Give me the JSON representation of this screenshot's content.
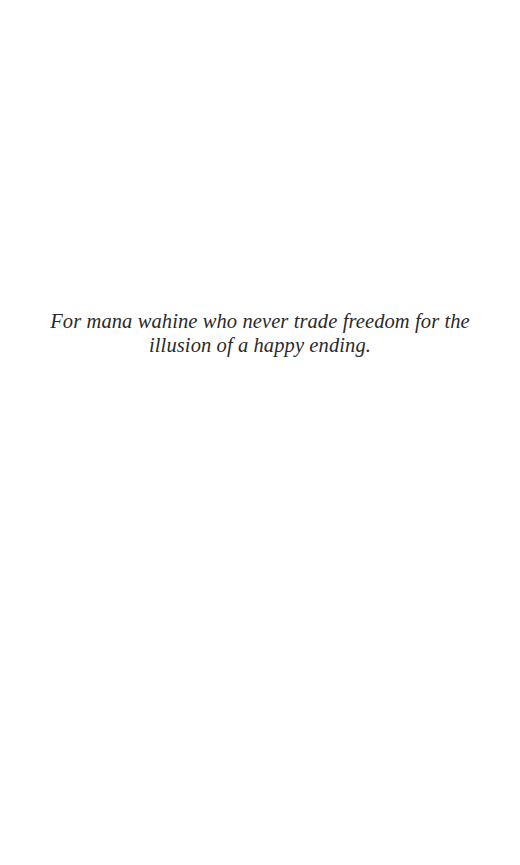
{
  "page": {
    "type": "dedication",
    "background_color": "#ffffff",
    "text_color": "#2a2a2a"
  },
  "dedication": {
    "text": "For mana wahine who never trade freedom for the illusion of a happy ending."
  }
}
